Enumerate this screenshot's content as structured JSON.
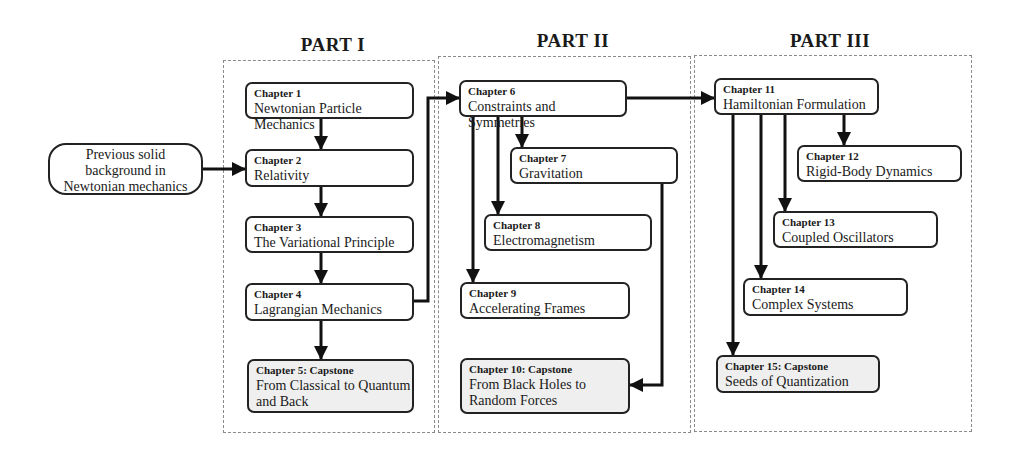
{
  "diagram": {
    "type": "course-roadmap-flowchart",
    "prerequisite": {
      "lines": [
        "Previous solid",
        "background in",
        "Newtonian mechanics"
      ]
    },
    "parts": [
      {
        "title": "PART I",
        "chapters": [
          {
            "label": "Chapter 1",
            "title": "Newtonian Particle Mechanics",
            "capstone": false
          },
          {
            "label": "Chapter 2",
            "title": "Relativity",
            "capstone": false
          },
          {
            "label": "Chapter 3",
            "title": "The Variational Principle",
            "capstone": false
          },
          {
            "label": "Chapter 4",
            "title": "Lagrangian Mechanics",
            "capstone": false
          },
          {
            "label": "Chapter 5: Capstone",
            "title": "From Classical to Quantum and Back",
            "title_lines": [
              "From Classical to Quantum",
              "and Back"
            ],
            "capstone": true
          }
        ]
      },
      {
        "title": "PART II",
        "chapters": [
          {
            "label": "Chapter 6",
            "title": "Constraints and Symmetries",
            "capstone": false
          },
          {
            "label": "Chapter 7",
            "title": "Gravitation",
            "capstone": false
          },
          {
            "label": "Chapter 8",
            "title": "Electromagnetism",
            "capstone": false
          },
          {
            "label": "Chapter 9",
            "title": "Accelerating Frames",
            "capstone": false
          },
          {
            "label": "Chapter 10: Capstone",
            "title": "From Black Holes to Random Forces",
            "title_lines": [
              "From Black Holes to",
              "Random Forces"
            ],
            "capstone": true
          }
        ]
      },
      {
        "title": "PART III",
        "chapters": [
          {
            "label": "Chapter 11",
            "title": "Hamiltonian Formulation",
            "capstone": false
          },
          {
            "label": "Chapter 12",
            "title": "Rigid-Body Dynamics",
            "capstone": false
          },
          {
            "label": "Chapter 13",
            "title": "Coupled Oscillators",
            "capstone": false
          },
          {
            "label": "Chapter 14",
            "title": "Complex Systems",
            "capstone": false
          },
          {
            "label": "Chapter 15: Capstone",
            "title": "Seeds of Quantization",
            "capstone": true
          }
        ]
      }
    ],
    "edges": [
      [
        "Previous",
        "Chapter 2"
      ],
      [
        "Chapter 1",
        "Chapter 2"
      ],
      [
        "Chapter 2",
        "Chapter 3"
      ],
      [
        "Chapter 3",
        "Chapter 4"
      ],
      [
        "Chapter 4",
        "Chapter 5"
      ],
      [
        "Chapter 4",
        "Chapter 6"
      ],
      [
        "Chapter 6",
        "Chapter 7"
      ],
      [
        "Chapter 6",
        "Chapter 8"
      ],
      [
        "Chapter 6",
        "Chapter 9"
      ],
      [
        "Chapter 7",
        "Chapter 10"
      ],
      [
        "Chapter 6",
        "Chapter 11"
      ],
      [
        "Chapter 11",
        "Chapter 12"
      ],
      [
        "Chapter 11",
        "Chapter 13"
      ],
      [
        "Chapter 11",
        "Chapter 14"
      ],
      [
        "Chapter 11",
        "Chapter 15"
      ]
    ],
    "colors": {
      "line": "#111111",
      "box_border": "#222222",
      "capstone_fill": "#efefef",
      "part_border": "#8a8a8a"
    }
  }
}
